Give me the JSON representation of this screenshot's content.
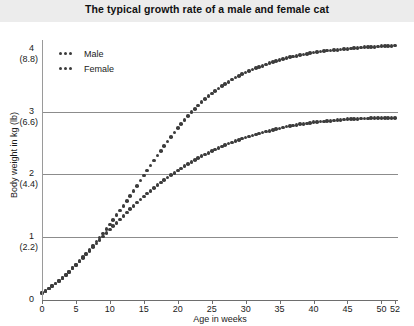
{
  "title": "The typical growth rate of a male and female cat",
  "legend": {
    "position": "top-left",
    "entries": [
      {
        "label": "Male",
        "marker": "dotted-line",
        "color": "#3c3c3c"
      },
      {
        "label": "Female",
        "marker": "dotted-line",
        "color": "#3c3c3c"
      }
    ]
  },
  "axis": {
    "x_label": "Age in weeks",
    "y_label": "Body weight in kg (lb)",
    "x_ticks": [
      "0",
      "5",
      "10",
      "15",
      "20",
      "25",
      "30",
      "35",
      "40",
      "45",
      "50",
      "52"
    ],
    "y_ticks": [
      {
        "kg": "4",
        "lb": "(8.8)"
      },
      {
        "kg": "3",
        "lb": "(6.6)"
      },
      {
        "kg": "2",
        "lb": "(4.4)"
      },
      {
        "kg": "1",
        "lb": "(2.2)"
      },
      {
        "kg": "0",
        "lb": ""
      }
    ]
  },
  "colors": {
    "marker": "#3c3c3c",
    "gridline": "#8c8c8c",
    "axis": "#6e6e6e",
    "title_band": "#ececec",
    "background": "#ffffff"
  },
  "chart_data": {
    "type": "scatter",
    "title": "The typical growth rate of a male and female cat",
    "xlabel": "Age in weeks",
    "ylabel": "Body weight in kg (lb)",
    "xlim": [
      0,
      52
    ],
    "ylim": [
      0,
      4.3
    ],
    "grid": true,
    "gridlines_y": [
      1,
      2,
      3
    ],
    "legend_position": "top-left",
    "x": [
      0,
      1,
      2,
      3,
      4,
      5,
      6,
      7,
      8,
      9,
      10,
      11,
      12,
      13,
      14,
      15,
      16,
      17,
      18,
      19,
      20,
      21,
      22,
      23,
      24,
      25,
      26,
      27,
      28,
      29,
      30,
      31,
      32,
      33,
      34,
      35,
      36,
      37,
      38,
      39,
      40,
      41,
      42,
      43,
      44,
      45,
      46,
      47,
      48,
      49,
      50,
      51,
      52
    ],
    "series": [
      {
        "name": "Male",
        "values": [
          0.11,
          0.18,
          0.26,
          0.35,
          0.45,
          0.56,
          0.68,
          0.8,
          0.93,
          1.06,
          1.2,
          1.35,
          1.5,
          1.66,
          1.82,
          1.98,
          2.14,
          2.3,
          2.45,
          2.6,
          2.74,
          2.87,
          2.99,
          3.1,
          3.2,
          3.29,
          3.37,
          3.44,
          3.51,
          3.57,
          3.62,
          3.67,
          3.71,
          3.75,
          3.79,
          3.82,
          3.85,
          3.88,
          3.9,
          3.92,
          3.94,
          3.96,
          3.97,
          3.98,
          3.99,
          4.0,
          4.01,
          4.02,
          4.03,
          4.03,
          4.04,
          4.04,
          4.05
        ]
      },
      {
        "name": "Female",
        "values": [
          0.11,
          0.18,
          0.26,
          0.35,
          0.45,
          0.56,
          0.67,
          0.78,
          0.9,
          1.01,
          1.12,
          1.23,
          1.34,
          1.45,
          1.55,
          1.65,
          1.74,
          1.83,
          1.91,
          1.99,
          2.06,
          2.13,
          2.2,
          2.26,
          2.32,
          2.37,
          2.42,
          2.47,
          2.51,
          2.55,
          2.59,
          2.62,
          2.65,
          2.68,
          2.71,
          2.73,
          2.76,
          2.78,
          2.8,
          2.81,
          2.83,
          2.84,
          2.85,
          2.86,
          2.87,
          2.88,
          2.88,
          2.89,
          2.89,
          2.9,
          2.9,
          2.9,
          2.9
        ]
      }
    ]
  }
}
